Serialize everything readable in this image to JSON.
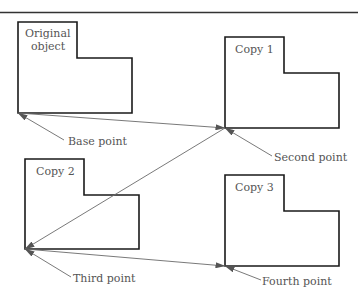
{
  "figure": {
    "top_rule": true,
    "objects": [
      {
        "id": "original",
        "label_lines": [
          "Original",
          "object"
        ]
      },
      {
        "id": "copy1",
        "label_lines": [
          "Copy 1"
        ]
      },
      {
        "id": "copy2",
        "label_lines": [
          "Copy 2"
        ]
      },
      {
        "id": "copy3",
        "label_lines": [
          "Copy 3"
        ]
      }
    ],
    "points": [
      {
        "id": "base",
        "label": "Base point"
      },
      {
        "id": "second",
        "label": "Second point"
      },
      {
        "id": "third",
        "label": "Third point"
      },
      {
        "id": "fourth",
        "label": "Fourth point"
      }
    ],
    "connections": [
      {
        "from": "Base point",
        "to": "Second point"
      },
      {
        "from": "Second point",
        "to": "Third point"
      },
      {
        "from": "Third point",
        "to": "Fourth point"
      }
    ],
    "colors": {
      "outline": "#1a1a1a",
      "arrow": "#6a6a6a",
      "text": "#555555"
    }
  }
}
